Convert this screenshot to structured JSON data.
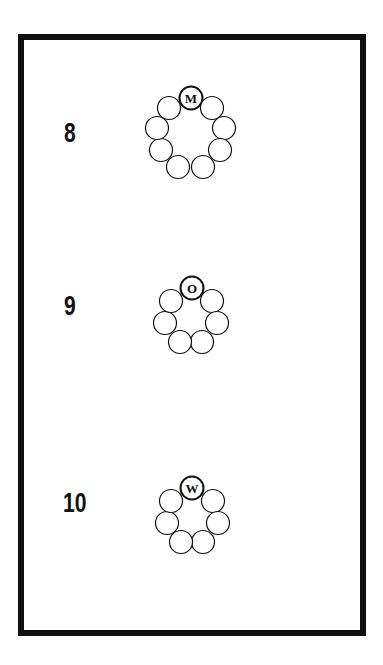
{
  "puzzles": [
    {
      "number": "8",
      "letter": "M",
      "number_pos": {
        "x": 64,
        "y": 120
      },
      "circle_radius": 11.5,
      "circles": [
        {
          "x": 191,
          "y": 98,
          "letter": "M"
        },
        {
          "x": 212,
          "y": 108
        },
        {
          "x": 224,
          "y": 128
        },
        {
          "x": 220,
          "y": 150
        },
        {
          "x": 203,
          "y": 167
        },
        {
          "x": 178,
          "y": 167
        },
        {
          "x": 161,
          "y": 150
        },
        {
          "x": 157,
          "y": 128
        },
        {
          "x": 169,
          "y": 108
        }
      ]
    },
    {
      "number": "9",
      "letter": "O",
      "number_pos": {
        "x": 64,
        "y": 293
      },
      "circle_radius": 11.5,
      "circles": [
        {
          "x": 192,
          "y": 288,
          "letter": "O"
        },
        {
          "x": 212,
          "y": 301
        },
        {
          "x": 217,
          "y": 323
        },
        {
          "x": 202,
          "y": 342
        },
        {
          "x": 180,
          "y": 342
        },
        {
          "x": 165,
          "y": 323
        },
        {
          "x": 171,
          "y": 301
        }
      ]
    },
    {
      "number": "10",
      "letter": "W",
      "number_pos": {
        "x": 63,
        "y": 490
      },
      "circle_radius": 11.5,
      "circles": [
        {
          "x": 192,
          "y": 488,
          "letter": "W"
        },
        {
          "x": 213,
          "y": 501
        },
        {
          "x": 218,
          "y": 523
        },
        {
          "x": 203,
          "y": 542
        },
        {
          "x": 181,
          "y": 542
        },
        {
          "x": 167,
          "y": 523
        },
        {
          "x": 171,
          "y": 501
        }
      ]
    }
  ],
  "colors": {
    "ink": "#111111",
    "paper": "#ffffff"
  }
}
